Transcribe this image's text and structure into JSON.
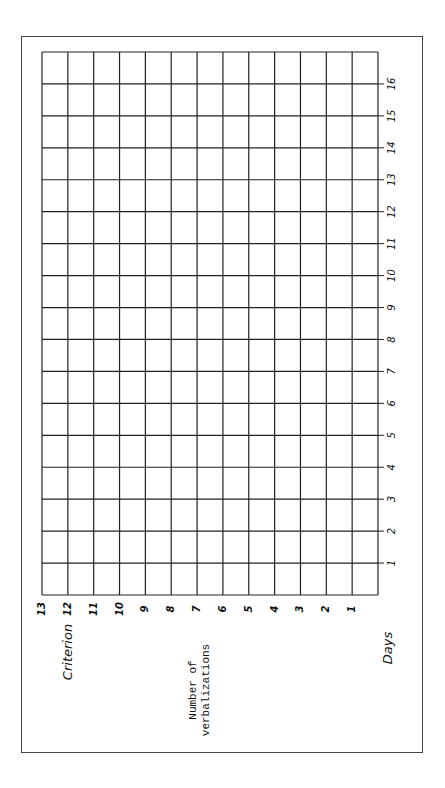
{
  "chart_data": {
    "type": "line",
    "title": "",
    "orientation": "rotated-90-clockwise",
    "xlabel": "Days",
    "ylabel": "Number of verbalizations",
    "x": [
      1,
      2,
      3,
      4,
      5,
      6,
      7,
      8,
      9,
      10,
      11,
      12,
      13,
      14,
      15,
      16
    ],
    "x_tick_labels": [
      "1",
      "2",
      "3",
      "4",
      "5",
      "6",
      "7",
      "8",
      "9",
      "10",
      "11",
      "12",
      "13",
      "14",
      "15",
      "16"
    ],
    "y_tick_labels": [
      "1",
      "2",
      "3",
      "4",
      "5",
      "6",
      "7",
      "8",
      "9",
      "10",
      "11",
      "12",
      "13"
    ],
    "xlim": [
      0,
      17
    ],
    "ylim": [
      0,
      13
    ],
    "series": [],
    "annotations": [
      {
        "text": "Criterion",
        "y": 12
      }
    ],
    "grid": true,
    "legend": null
  },
  "labels": {
    "days": "Days",
    "ylabel_line1": "Number of",
    "ylabel_line2": "verbalizations",
    "criterion": "Criterion"
  },
  "colors": {
    "grid": "#222222",
    "frame": "#444444",
    "text": "#111111"
  }
}
